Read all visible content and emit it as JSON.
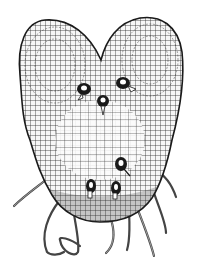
{
  "image": {
    "subject": "fern-prothallus-illustration",
    "width": 202,
    "height": 270,
    "colors": {
      "background": "#ffffff",
      "ink": "#1a1a1a",
      "cell_fill": "#f4f4f4",
      "shade": "#555555"
    },
    "structures": {
      "archegonia_count": 3,
      "antheridia_count": 3,
      "rhizoid_count": 10
    }
  }
}
